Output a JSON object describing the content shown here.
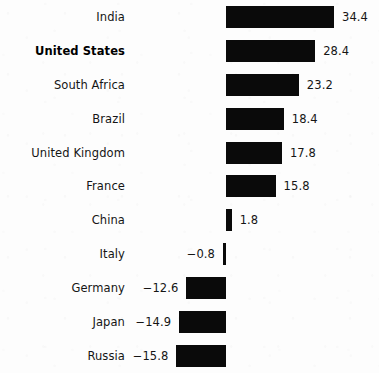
{
  "chart_data": {
    "type": "bar",
    "orientation": "horizontal",
    "title": "",
    "subtitle": "",
    "xlabel": "",
    "ylabel": "",
    "grid": false,
    "legend": false,
    "zero_baseline": true,
    "xlim": [
      -15.8,
      34.4
    ],
    "categories": [
      "India",
      "United States",
      "South Africa",
      "Brazil",
      "United Kingdom",
      "France",
      "China",
      "Italy",
      "Germany",
      "Japan",
      "Russia"
    ],
    "values": [
      34.4,
      28.4,
      23.2,
      18.4,
      17.8,
      15.8,
      1.8,
      -0.8,
      -12.6,
      -14.9,
      -15.8
    ],
    "value_labels": [
      "34.4",
      "28.4",
      "23.2",
      "18.4",
      "17.8",
      "15.8",
      "1.8",
      "−0.8",
      "−12.6",
      "−14.9",
      "−15.8"
    ],
    "highlighted_category": "United States",
    "bar_color": "#0a0a0a",
    "background_color": "#fdfdfd",
    "text_color": "#151515"
  }
}
